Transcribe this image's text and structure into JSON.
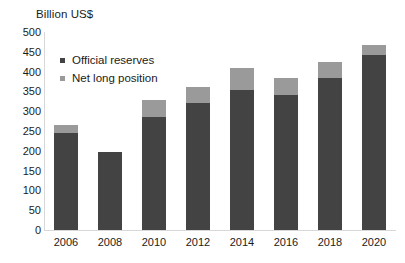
{
  "chart_data": {
    "type": "bar",
    "title": "Billion US$",
    "xlabel": "",
    "ylabel": "Billion US$",
    "ylim": [
      0,
      500
    ],
    "ytick_step": 50,
    "yticks": [
      500,
      450,
      400,
      350,
      300,
      250,
      200,
      150,
      100,
      50,
      0
    ],
    "grid": false,
    "stacked": true,
    "legend_position": "top-left-inside",
    "categories": [
      "2006",
      "2008",
      "2010",
      "2012",
      "2014",
      "2016",
      "2018",
      "2020"
    ],
    "series": [
      {
        "name": "Official reserves",
        "color": "#434343",
        "values": [
          245,
          197,
          285,
          320,
          353,
          341,
          384,
          442
        ]
      },
      {
        "name": "Net long position",
        "color": "#9a9a9a",
        "values": [
          20,
          0,
          43,
          41,
          55,
          43,
          40,
          25
        ]
      }
    ],
    "totals": [
      265,
      197,
      328,
      361,
      408,
      384,
      424,
      467
    ]
  },
  "axis": {
    "title": "Billion US$",
    "ytick_labels": [
      "500",
      "450",
      "400",
      "350",
      "300",
      "250",
      "200",
      "150",
      "100",
      "50",
      "0"
    ],
    "xtick_labels": [
      "2006",
      "2008",
      "2010",
      "2012",
      "2014",
      "2016",
      "2018",
      "2020"
    ]
  },
  "legend": {
    "items": [
      {
        "label": "Official reserves",
        "color": "#434343"
      },
      {
        "label": "Net long position",
        "color": "#9a9a9a"
      }
    ]
  }
}
